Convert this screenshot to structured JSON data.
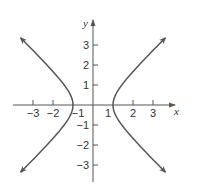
{
  "chart_data": {
    "type": "line",
    "title": "",
    "equation": "x^2 - y^2 = 1",
    "xlabel": "x",
    "ylabel": "y",
    "xlim": [
      -4,
      4
    ],
    "ylim": [
      -4,
      4
    ],
    "x_ticks": [
      -3,
      -2,
      -1,
      1,
      2,
      3
    ],
    "y_ticks": [
      -3,
      -2,
      -1,
      1,
      2,
      3
    ],
    "x_tick_labels": [
      "−3",
      "−2",
      "−1",
      "1",
      "2",
      "3"
    ],
    "y_tick_labels": [
      "−3",
      "−2",
      "−1",
      "1",
      "2",
      "3"
    ],
    "grid": false,
    "legend": null,
    "series": [
      {
        "name": "right branch",
        "points": [
          [
            3.6,
            -3.46
          ],
          [
            3,
            -2.83
          ],
          [
            2,
            -1.73
          ],
          [
            1.5,
            -1.12
          ],
          [
            1.2,
            -0.66
          ],
          [
            1,
            0
          ],
          [
            1.2,
            0.66
          ],
          [
            1.5,
            1.12
          ],
          [
            2,
            1.73
          ],
          [
            3,
            2.83
          ],
          [
            3.6,
            3.46
          ]
        ],
        "arrows": "both"
      },
      {
        "name": "left branch",
        "points": [
          [
            -3.6,
            -3.46
          ],
          [
            -3,
            -2.83
          ],
          [
            -2,
            -1.73
          ],
          [
            -1.5,
            -1.12
          ],
          [
            -1.2,
            -0.66
          ],
          [
            -1,
            0
          ],
          [
            -1.2,
            0.66
          ],
          [
            -1.5,
            1.12
          ],
          [
            -2,
            1.73
          ],
          [
            -3,
            2.83
          ],
          [
            -3.6,
            3.46
          ]
        ],
        "arrows": "both"
      }
    ],
    "colors": {
      "curve": "#555555",
      "axis": "#555555"
    }
  }
}
